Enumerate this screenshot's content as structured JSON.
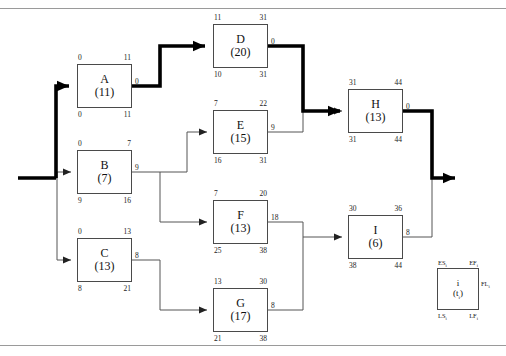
{
  "diagram": {
    "type": "aon-network",
    "critical_path": [
      "start",
      "A",
      "D",
      "H",
      "end"
    ],
    "project_duration": 44
  },
  "nodes": [
    {
      "id": "A",
      "label": "A",
      "duration_text": "(11)",
      "duration": 11,
      "es": "0",
      "ef": "11",
      "ls": "0",
      "lf": "11",
      "float": "0",
      "critical": true,
      "x": 77,
      "y": 64,
      "w": 55,
      "h": 44
    },
    {
      "id": "B",
      "label": "B",
      "duration_text": "(7)",
      "duration": 7,
      "es": "0",
      "ef": "7",
      "ls": "9",
      "lf": "16",
      "float": "9",
      "critical": false,
      "x": 77,
      "y": 150,
      "w": 55,
      "h": 44
    },
    {
      "id": "C",
      "label": "C",
      "duration_text": "(13)",
      "duration": 13,
      "es": "0",
      "ef": "13",
      "ls": "8",
      "lf": "21",
      "float": "8",
      "critical": false,
      "x": 77,
      "y": 238,
      "w": 55,
      "h": 44
    },
    {
      "id": "D",
      "label": "D",
      "duration_text": "(20)",
      "duration": 20,
      "es": "11",
      "ef": "31",
      "ls": "10",
      "lf": "31",
      "float": "0",
      "critical": true,
      "x": 213,
      "y": 24,
      "w": 55,
      "h": 44
    },
    {
      "id": "E",
      "label": "E",
      "duration_text": "(15)",
      "duration": 15,
      "es": "7",
      "ef": "22",
      "ls": "16",
      "lf": "31",
      "float": "9",
      "critical": false,
      "x": 213,
      "y": 110,
      "w": 55,
      "h": 44
    },
    {
      "id": "F",
      "label": "F",
      "duration_text": "(13)",
      "duration": 13,
      "es": "7",
      "ef": "20",
      "ls": "25",
      "lf": "38",
      "float": "18",
      "critical": false,
      "x": 213,
      "y": 200,
      "w": 55,
      "h": 44
    },
    {
      "id": "G",
      "label": "G",
      "duration_text": "(17)",
      "duration": 17,
      "es": "13",
      "ef": "30",
      "ls": "21",
      "lf": "38",
      "float": "8",
      "critical": false,
      "x": 213,
      "y": 288,
      "w": 55,
      "h": 44
    },
    {
      "id": "H",
      "label": "H",
      "duration_text": "(13)",
      "duration": 13,
      "es": "31",
      "ef": "44",
      "ls": "31",
      "lf": "44",
      "float": "0",
      "critical": true,
      "x": 348,
      "y": 89,
      "w": 55,
      "h": 44
    },
    {
      "id": "I",
      "label": "I",
      "duration_text": "(6)",
      "duration": 6,
      "es": "30",
      "ef": "36",
      "ls": "38",
      "lf": "44",
      "float": "8",
      "critical": false,
      "x": 348,
      "y": 215,
      "w": 55,
      "h": 44
    }
  ],
  "legend": {
    "box": {
      "x": 437,
      "y": 268,
      "w": 42,
      "h": 42
    },
    "activity_symbol": "i",
    "duration_symbol": "(t",
    "duration_sub": "i",
    "duration_close": ")",
    "es_label": "ES",
    "es_sub": "i",
    "ef_label": "EF",
    "ef_sub": "i",
    "fl_label": "FL",
    "fl_sub": "i",
    "ls_label": "LS",
    "ls_sub": "i",
    "lf_label": "LF",
    "lf_sub": "i"
  },
  "edges": [
    {
      "from": "start",
      "to": "A",
      "critical": true
    },
    {
      "from": "start",
      "to": "B",
      "critical": false
    },
    {
      "from": "start",
      "to": "C",
      "critical": false
    },
    {
      "from": "A",
      "to": "D",
      "critical": true
    },
    {
      "from": "B",
      "to": "E",
      "critical": false
    },
    {
      "from": "B",
      "to": "F",
      "critical": false
    },
    {
      "from": "C",
      "to": "G",
      "critical": false
    },
    {
      "from": "D",
      "to": "H",
      "critical": true
    },
    {
      "from": "E",
      "to": "H",
      "critical": false
    },
    {
      "from": "F",
      "to": "I",
      "critical": false
    },
    {
      "from": "G",
      "to": "I",
      "critical": false
    },
    {
      "from": "H",
      "to": "end",
      "critical": true
    },
    {
      "from": "I",
      "to": "end",
      "critical": false
    }
  ],
  "colors": {
    "node_border": "#4a4a4a",
    "thin_line": "#555555",
    "critical_line": "#000000",
    "rule": "#9a9a9a",
    "text": "#111111"
  }
}
